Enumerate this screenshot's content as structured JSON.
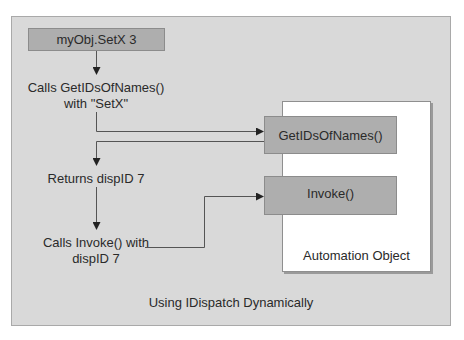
{
  "diagram": {
    "caption": "Using IDispatch Dynamically",
    "start_box": "myObj.SetX 3",
    "steps": [
      {
        "line1": "Calls GetIDsOfNames()",
        "line2": "with \"SetX\""
      },
      {
        "line1": "Returns dispID 7"
      },
      {
        "line1": "Calls Invoke() with",
        "line2": "dispID 7"
      }
    ],
    "object": {
      "label": "Automation Object",
      "methods": [
        "GetIDsOfNames()",
        "Invoke()"
      ]
    },
    "colors": {
      "panel": "#d9d9d9",
      "method_box": "#aeaeae",
      "object_box": "#ffffff",
      "line": "#555555"
    }
  }
}
